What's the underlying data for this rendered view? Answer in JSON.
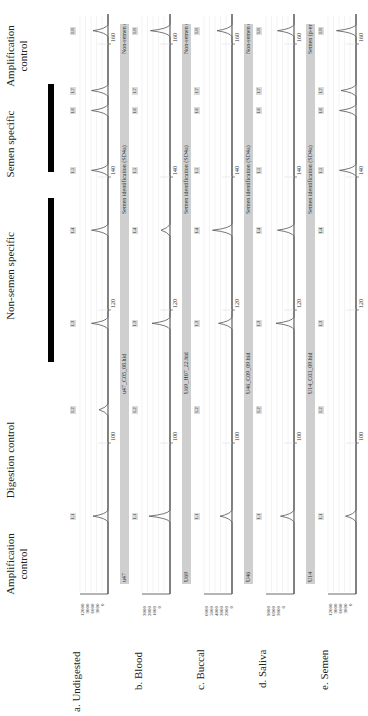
{
  "chart_data": {
    "type": "line",
    "xlabel": "Fragment size (bp)",
    "ylabel": "RFU",
    "xlim": [
      80,
      166
    ],
    "x_ticks": [
      100,
      120,
      140,
      160
    ],
    "rotated": "90deg counter-clockwise",
    "column_headers": [
      {
        "label": "Amplification control",
        "loci": [
          "L1"
        ]
      },
      {
        "label": "Digestion control",
        "loci": [
          "L2"
        ]
      },
      {
        "label": "Non-semen specific",
        "loci": [
          "L3",
          "L4"
        ]
      },
      {
        "label": "Semen specific",
        "loci": [
          "L5",
          "L6",
          "L7"
        ]
      },
      {
        "label": "Amplification control",
        "loci": [
          "L8"
        ]
      }
    ],
    "loci_positions_bp": {
      "L1": 89,
      "L2": 105,
      "L3": 118,
      "L4": 132,
      "L5": 141,
      "L6": 150,
      "L7": 153,
      "L8": 162
    },
    "panels": [
      {
        "label": "a. Undigested",
        "sample": "",
        "header": "",
        "y_ticks": [
          12000,
          9000,
          6000,
          3000,
          0
        ],
        "peaks": {
          "L1": 0.5,
          "L2": 0.3,
          "L3": 0.55,
          "L4": 0.55,
          "L5": 0.55,
          "L6": 0.55,
          "L7": 0.55,
          "L8": 0.5
        }
      },
      {
        "label": "b. Blood",
        "sample": "u47",
        "header": "u47_C05_08.hid   Semen identification (SD4a)   Non-semen (p-error: 6.08554E-07)",
        "file": "u47_C05_08.hid",
        "assay": "Semen identification (SD4a)",
        "call": "Non-semen (p-error: 6.08554E-07)",
        "y_ticks": [
          3000,
          2000,
          1000,
          0
        ],
        "peaks": {
          "L1": 0.7,
          "L2": 0,
          "L3": 0.6,
          "L4": 0.3,
          "L5": 0,
          "L6": 0,
          "L7": 0,
          "L8": 0.65
        }
      },
      {
        "label": "c. Buccal",
        "sample": "U69",
        "header": "U69_H07_22.hid   Semen identification (SD4a)   Non-semen (p-error: 4.37019E-11)",
        "file": "U69_H07_22.hid",
        "assay": "Semen identification (SD4a)",
        "call": "Non-semen (p-error: 4.37019E-11)",
        "y_ticks": [
          6000,
          5000,
          4000,
          3000,
          2000,
          0
        ],
        "peaks": {
          "L1": 0.4,
          "L2": 0,
          "L3": 0.45,
          "L4": 0.65,
          "L5": 0,
          "L6": 0,
          "L7": 0,
          "L8": 0.5
        }
      },
      {
        "label": "d. Saliva",
        "sample": "U46",
        "header": "U46_C09_09.hid   Semen identification (SD4a)   Non-semen (p-error: 4.37019E-11)",
        "file": "U46_C09_09.hid",
        "assay": "Semen identification (SD4a)",
        "call": "Non-semen (p-error: 4.37019E-11)",
        "y_ticks": [
          9000,
          6000,
          3000,
          0
        ],
        "peaks": {
          "L1": 0.45,
          "L2": 0,
          "L3": 0.6,
          "L4": 0.55,
          "L5": 0,
          "L6": 0,
          "L7": 0,
          "L8": 0.55
        }
      },
      {
        "label": "e. Semen",
        "sample": "U14",
        "header": "U14_C03_09.hid   Semen identification (SD4a)   Semen (p-error: 1.88915E-10)",
        "file": "U14_C03_09.hid",
        "assay": "Semen identification (SD4a)",
        "call": "Semen (p-error: 1.88915E-10)",
        "y_ticks": [
          12000,
          9000,
          6000,
          3000,
          0
        ],
        "peaks": {
          "L1": 0.35,
          "L2": 0,
          "L3": 0,
          "L4": 0,
          "L5": 0.55,
          "L6": 0.55,
          "L7": 0.5,
          "L8": 0.65
        }
      }
    ]
  },
  "labels": {
    "col1": "Amplification control",
    "col2": "Digestion control",
    "col3": "Non-semen specific",
    "col4": "Semen specific",
    "col5": "Amplification control",
    "rows": [
      "a. Undigested",
      "b. Blood",
      "c. Buccal",
      "d. Saliva",
      "e. Semen"
    ],
    "samples": [
      "",
      "u47",
      "U69",
      "U46",
      "U14"
    ],
    "files": [
      "",
      "u47_C05_08.hid",
      "U69_H07_22.hid",
      "U46_C09_09.hid",
      "U14_C03_09.hid"
    ],
    "assay": "Semen identification (SD4a)",
    "calls": [
      "",
      "Non-semen (p-error: 6.08554E-07)",
      "Non-semen (p-error: 4.37019E-11)",
      "Non-semen (p-error: 4.37019E-11)",
      "Semen (p-error: 1.88915E-10)"
    ],
    "ticks": [
      "100",
      "120",
      "140",
      "160"
    ],
    "loci": [
      "L1",
      "L2",
      "L3",
      "L4",
      "L5",
      "L6",
      "L7",
      "L8"
    ]
  },
  "colors": {
    "trace": "#555555",
    "header_bar": "#cfcfcf",
    "grid": "#e6e6e6",
    "marker_bar": "#000000"
  }
}
